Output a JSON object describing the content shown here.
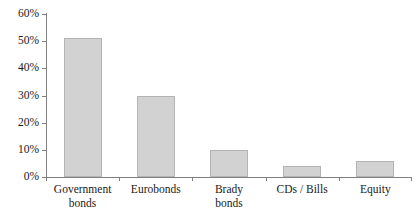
{
  "chart_data": {
    "type": "bar",
    "title": "",
    "xlabel": "",
    "ylabel": "",
    "categories": [
      "Government bonds",
      "Eurobonds",
      "Brady bonds",
      "CDs / Bills",
      "Equity"
    ],
    "category_labels_wrapped": [
      "Government\nbonds",
      "Eurobonds",
      "Brady\nbonds",
      "CDs / Bills",
      "Equity"
    ],
    "values": [
      51,
      30,
      10,
      4,
      6
    ],
    "value_labels": [
      "51%",
      "30%",
      "10%",
      "4%",
      "6%"
    ],
    "ylim": [
      0,
      60
    ],
    "ytick_values": [
      0,
      10,
      20,
      30,
      40,
      50,
      60
    ],
    "ytick_labels": [
      "0%",
      "10%",
      "20%",
      "30%",
      "40%",
      "50%",
      "60%"
    ],
    "grid": false,
    "legend": null,
    "bar_color": "#d2d2d2",
    "bar_border_color": "#b4b4b4",
    "axis_color": "#808080",
    "background_color": "#ffffff"
  }
}
